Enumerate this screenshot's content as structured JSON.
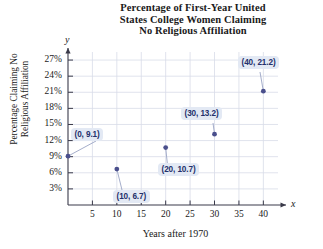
{
  "chart_data": {
    "type": "scatter",
    "title": "Percentage of First-Year United States College Women Claiming No Religious Affiliation",
    "title_lines": [
      "Percentage of First-Year United",
      "States College Women Claiming",
      "No Religious Affiliation"
    ],
    "xlabel": "Years after 1970",
    "ylabel": "Percentage Claiming No Religious Affiliation",
    "ylabel_lines": [
      "Percentage Claiming No",
      "Religious Affiliation"
    ],
    "x_axis_letter": "x",
    "y_axis_letter": "y",
    "xlim": [
      0,
      43
    ],
    "ylim": [
      0,
      28.5
    ],
    "xticks": [
      5,
      10,
      15,
      20,
      25,
      30,
      35,
      40
    ],
    "xtick_labels": [
      "5",
      "10",
      "15",
      "20",
      "25",
      "30",
      "35",
      "40"
    ],
    "yticks": [
      3,
      6,
      9,
      12,
      15,
      18,
      21,
      24,
      27
    ],
    "ytick_labels": [
      "3%",
      "6%",
      "9%",
      "12%",
      "15%",
      "18%",
      "21%",
      "24%",
      "27%"
    ],
    "grid": true,
    "legend": null,
    "x": [
      0,
      10,
      20,
      30,
      40
    ],
    "values": [
      9.1,
      6.7,
      10.7,
      13.2,
      21.2
    ],
    "points": [
      {
        "x": 0,
        "y": 9.1,
        "label": "(0, 9.1)"
      },
      {
        "x": 10,
        "y": 6.7,
        "label": "(10, 6.7)"
      },
      {
        "x": 20,
        "y": 10.7,
        "label": "(20, 10.7)"
      },
      {
        "x": 30,
        "y": 13.2,
        "label": "(30, 13.2)"
      },
      {
        "x": 40,
        "y": 21.2,
        "label": "(40, 21.2)"
      }
    ],
    "annotations": [
      "(0, 9.1)",
      "(10, 6.7)",
      "(20, 10.7)",
      "(30, 13.2)",
      "(40, 21.2)"
    ],
    "colors": {
      "point": "#4a4f8c",
      "axis": "#3a3a4a",
      "grid": "#d8dce8",
      "callout_bg": "#e3e9f4",
      "callout_text": "#23306b",
      "text": "#1a1a1a",
      "background": "#ffffff"
    }
  }
}
